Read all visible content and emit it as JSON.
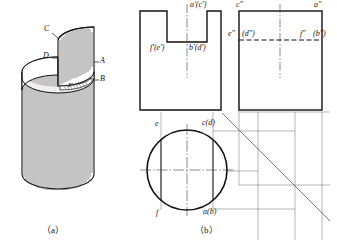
{
  "figure": {
    "captions": {
      "a": "（a）",
      "b": "（b）"
    }
  },
  "pictorial": {
    "name": "isometric-cylinder-with-slot",
    "labels": {
      "c": "C",
      "d": "D",
      "a": "A",
      "b": "B",
      "f": "F"
    }
  },
  "front_view": {
    "name": "front-view",
    "labels": {
      "top_right": "a'(c')",
      "notch_left": "f'(e')",
      "notch_right": "b'(d')"
    }
  },
  "side_view": {
    "name": "side-view",
    "labels": {
      "top_left": "c\"",
      "top_right": "a\"",
      "mid_left": "e\"",
      "mid_left2": "(d\")",
      "mid_right": "f\"",
      "mid_right2": "(b\")"
    }
  },
  "top_view": {
    "name": "top-view",
    "labels": {
      "upper_left": "e",
      "upper_right": "c(d)",
      "lower_left": "f",
      "lower_right": "a(b)"
    }
  },
  "colors": {
    "ink": "#15110f",
    "line": "#1a1a1a",
    "thin": "#555555",
    "hatch": "#2b2b2b",
    "surface": "#f2f0ec"
  }
}
